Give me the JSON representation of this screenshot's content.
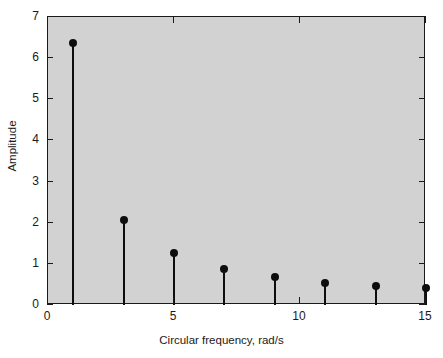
{
  "chart_data": {
    "type": "scatter",
    "plot_style": "stem",
    "title": "",
    "xlabel": "Circular frequency, rad/s",
    "ylabel": "Amplitude",
    "xlim": [
      0,
      15
    ],
    "ylim": [
      0,
      7
    ],
    "xticks": [
      0,
      5,
      10,
      15
    ],
    "xtick_labels": [
      "0",
      "5",
      "10",
      "15"
    ],
    "yticks": [
      0,
      1,
      2,
      3,
      4,
      5,
      6,
      7
    ],
    "ytick_labels": [
      "0",
      "1",
      "2",
      "3",
      "4",
      "5",
      "6",
      "7"
    ],
    "grid": false,
    "legend": null,
    "background_color": "#d2d2d2",
    "marker_color": "#0d0d0d",
    "stem_color": "#0d0d0d",
    "x": [
      1,
      3,
      5,
      7,
      9,
      11,
      13,
      15
    ],
    "values": [
      6.37,
      2.07,
      1.27,
      0.88,
      0.68,
      0.54,
      0.46,
      0.41
    ],
    "points": [
      {
        "x": 1,
        "y": 6.37
      },
      {
        "x": 3,
        "y": 2.07
      },
      {
        "x": 5,
        "y": 1.27
      },
      {
        "x": 7,
        "y": 0.88
      },
      {
        "x": 9,
        "y": 0.68
      },
      {
        "x": 11,
        "y": 0.54
      },
      {
        "x": 13,
        "y": 0.46
      },
      {
        "x": 15,
        "y": 0.41
      }
    ]
  }
}
